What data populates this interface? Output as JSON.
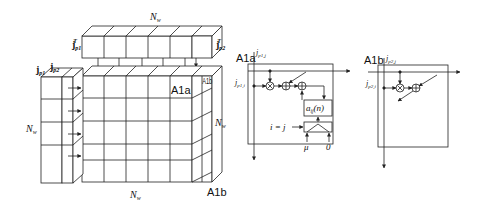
{
  "diagram": {
    "colors": {
      "stroke": "#222222",
      "background": "#ffffff"
    },
    "left_panel": {
      "top_label": "N",
      "top_label_sub": "w",
      "top_left_vector": "j",
      "top_left_vector_sub": "p1",
      "top_left_vector_sup": "T",
      "top_right_vector": "j",
      "top_right_vector_sub": "p2",
      "top_right_vector_sup": "T",
      "side_vector_1": "j",
      "side_vector_1_sub": "p1",
      "side_vector_2": "j",
      "side_vector_2_sub": "p2",
      "left_label": "N",
      "left_label_sub": "w",
      "right_label": "N",
      "right_label_sub": "w",
      "bottom_label": "N",
      "bottom_label_sub": "w",
      "cell_a_label": "A1a",
      "cell_b_label": "A1b",
      "cell_b_bottom_label": "A1b"
    },
    "cell_a1a": {
      "title": "A1a",
      "top_input": "j",
      "top_input_sub": "p1,j",
      "left_input": "j",
      "left_input_sub": "p1,i",
      "register": "a",
      "register_sub": "ij",
      "register_arg": "(n)",
      "condition": "i = j",
      "mux_in_left": "μ",
      "mux_in_right": "0"
    },
    "cell_a1b": {
      "title": "A1b",
      "top_input": "j",
      "top_input_sub": "p2,j",
      "left_input": "j",
      "left_input_sub": "p2,i"
    }
  }
}
